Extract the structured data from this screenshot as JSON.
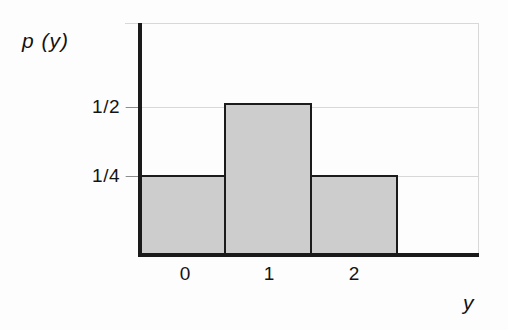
{
  "chart_data": {
    "type": "bar",
    "title": "",
    "subtitle": "",
    "xlabel": "y",
    "ylabel": "p (y)",
    "categories": [
      "0",
      "1",
      "2"
    ],
    "values": [
      0.25,
      0.5,
      0.25
    ],
    "value_labels": [
      "1/4",
      "1/2",
      "1/4"
    ],
    "x": [
      0,
      1,
      2
    ],
    "xlim": [
      -0.5,
      2.9
    ],
    "ylim": [
      0,
      0.84
    ],
    "y_tick_values": [
      0.5,
      0.25
    ],
    "y_tick_labels": [
      "1/2",
      "1/4"
    ],
    "x_tick_labels": [
      "0",
      "1",
      "2"
    ],
    "grid": true,
    "grid_axis": "y",
    "legend": null,
    "bar_width": 1.0,
    "annotations": [],
    "colors": {
      "bar_fill": "#cdcdcd",
      "bar_edge": "#1b1b1b",
      "axis": "#1a1a1a",
      "grid": "#d8d8d8",
      "text": "#141414",
      "background": "#fdfdfd"
    }
  },
  "axes": {
    "y_label": "p (y)",
    "x_label": "y"
  },
  "ticks": {
    "y": [
      {
        "label": "1/2",
        "value": 0.5
      },
      {
        "label": "1/4",
        "value": 0.25
      }
    ],
    "x": [
      {
        "label": "0",
        "value": 0
      },
      {
        "label": "1",
        "value": 1
      },
      {
        "label": "2",
        "value": 2
      }
    ]
  }
}
